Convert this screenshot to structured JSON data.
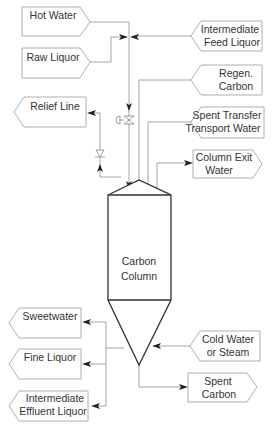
{
  "diagram": {
    "column": {
      "label_line1": "Carbon",
      "label_line2": "Column"
    },
    "inputs": [
      {
        "id": "hot-water",
        "line1": "Hot Water",
        "line2": ""
      },
      {
        "id": "raw-liquor",
        "line1": "Raw Liquor",
        "line2": ""
      },
      {
        "id": "intermediate-feed-liquor",
        "line1": "Intermediate",
        "line2": "Feed Liquor"
      },
      {
        "id": "regen-carbon",
        "line1": "Regen.",
        "line2": "Carbon"
      },
      {
        "id": "spent-transfer-transport-water",
        "line1": "Spent Transfer",
        "line2": "Transport Water"
      },
      {
        "id": "cold-water-or-steam",
        "line1": "Cold Water",
        "line2": "or Steam"
      }
    ],
    "outputs": [
      {
        "id": "relief-line",
        "line1": "Relief Line",
        "line2": ""
      },
      {
        "id": "column-exit-water",
        "line1": "Column Exit",
        "line2": "Water"
      },
      {
        "id": "sweetwater",
        "line1": "Sweetwater",
        "line2": ""
      },
      {
        "id": "fine-liquor",
        "line1": "Fine Liquor",
        "line2": ""
      },
      {
        "id": "intermediate-effluent-liquor",
        "line1": "Intermediate",
        "line2": "Effluent Liquor"
      },
      {
        "id": "spent-carbon",
        "line1": "Spent",
        "line2": "Carbon"
      }
    ],
    "colors": {
      "line": "#9a9a9a",
      "column_outline": "#333333",
      "arrow": "#222222",
      "text": "#333333"
    }
  }
}
